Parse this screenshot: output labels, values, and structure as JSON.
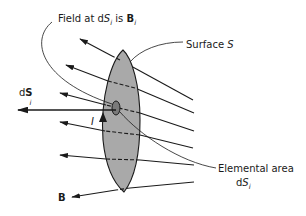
{
  "figure": {
    "labels": {
      "field_prefix": "Field at d",
      "field_S": "S",
      "field_sub": "i",
      "field_is": " is ",
      "field_B": "B",
      "field_B_sub": "i",
      "surface_prefix": "Surface ",
      "surface_S": "S",
      "dS_d": "d",
      "dS_S": "S",
      "dS_sub": "i",
      "current": "I",
      "elemental_line1": "Elemental area",
      "elemental_d": "d",
      "elemental_S": "S",
      "elemental_sub": "i",
      "B_field": "B"
    },
    "colors": {
      "surface_fill": "#a9a9a9",
      "line": "#1a1a1a",
      "background": "#ffffff"
    }
  }
}
